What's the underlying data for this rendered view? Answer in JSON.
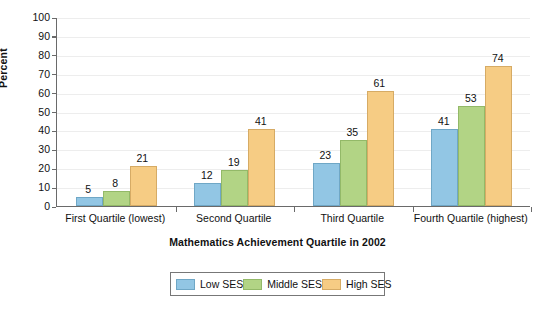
{
  "chart_data": {
    "type": "bar",
    "title": "",
    "xlabel": "Mathematics Achievement Quartile in 2002",
    "ylabel": "Percent",
    "ylim": [
      0,
      100
    ],
    "ytick_step": 10,
    "yticks": [
      0,
      10,
      20,
      30,
      40,
      50,
      60,
      70,
      80,
      90,
      100
    ],
    "grid": true,
    "legend_position": "bottom",
    "categories": [
      "First Quartile (lowest)",
      "Second Quartile",
      "Third Quartile",
      "Fourth Quartile (highest)"
    ],
    "series": [
      {
        "name": "Low SES",
        "color": "#92c6e4",
        "values": [
          5,
          12,
          23,
          41
        ]
      },
      {
        "name": "Middle SES",
        "color": "#b2d485",
        "values": [
          8,
          19,
          35,
          53
        ]
      },
      {
        "name": "High SES",
        "color": "#f6cc84",
        "values": [
          21,
          41,
          61,
          74
        ]
      }
    ]
  }
}
